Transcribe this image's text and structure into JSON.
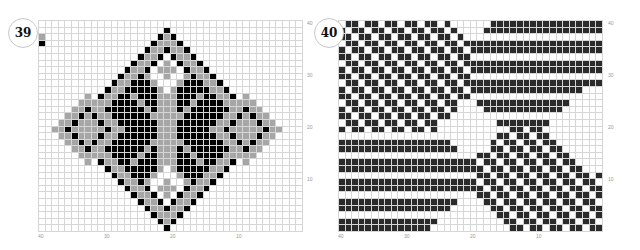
{
  "panels": [
    {
      "id": "39",
      "label": "39",
      "grid": {
        "cols": 40,
        "rows": 32
      },
      "colors": {
        "background": "#ffffff",
        "black": "#000000",
        "gray": "#a6a6a6",
        "gridline": "#d6d6d6"
      },
      "x_ticks": [
        "40",
        "30",
        "20",
        "10"
      ],
      "y_ticks": [
        "40",
        "30",
        "20",
        "10"
      ]
    },
    {
      "id": "40",
      "label": "40",
      "grid": {
        "cols": 40,
        "rows": 32
      },
      "colors": {
        "background": "#ffffff",
        "dark": "#2b2b2b",
        "gridline": "#d6d6d6"
      },
      "x_ticks": [
        "40",
        "30",
        "20",
        "10"
      ],
      "y_ticks": [
        "40",
        "30",
        "20",
        "10"
      ]
    }
  ]
}
